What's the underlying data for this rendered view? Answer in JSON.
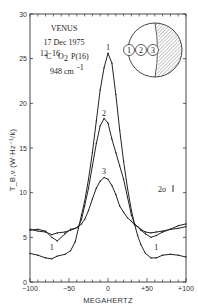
{
  "chart_data": {
    "type": "line",
    "title": "VENUS",
    "annotations": {
      "target": "VENUS",
      "date": "17 Dec 1975",
      "molecule_prefix1": "12",
      "molecule_c": "C",
      "molecule_prefix2": "16",
      "molecule_o": "O",
      "molecule_sub": "2",
      "line": "P(16)",
      "wavenumber": "948 cm",
      "wavenumber_exp": "-1",
      "error_bar": "2σ",
      "inset_labels": [
        "1",
        "2",
        "3"
      ]
    },
    "xlabel": "MEGAHERTZ",
    "ylabel": "T_B,ν (W·Hz⁻¹/k)",
    "xlim": [
      -100,
      100
    ],
    "ylim": [
      0,
      30
    ],
    "x_ticks": [
      "-100",
      "-50",
      "0",
      "+50",
      "+100"
    ],
    "y_ticks": [
      "0",
      "5",
      "10",
      "15",
      "20",
      "25",
      "30"
    ],
    "grid": false,
    "series": [
      {
        "name": "1",
        "x": [
          -100,
          -90,
          -80,
          -72,
          -65,
          -55,
          -48,
          -42,
          -38,
          -34,
          -30,
          -25,
          -20,
          -15,
          -10,
          -5,
          0,
          5,
          10,
          15,
          20,
          25,
          30,
          34,
          38,
          42,
          48,
          55,
          62,
          70,
          80,
          90,
          100
        ],
        "values": [
          3.2,
          3.0,
          2.7,
          2.6,
          2.9,
          3.1,
          3.5,
          4.5,
          6.0,
          7.5,
          9.0,
          11.5,
          14.5,
          18.0,
          21.5,
          24.0,
          25.6,
          24.5,
          21.0,
          17.0,
          13.5,
          10.5,
          8.0,
          6.5,
          5.2,
          4.2,
          3.2,
          2.7,
          2.7,
          3.0,
          3.1,
          3.0,
          2.8
        ]
      },
      {
        "name": "2",
        "x": [
          -100,
          -90,
          -80,
          -72,
          -65,
          -55,
          -48,
          -42,
          -38,
          -34,
          -30,
          -25,
          -20,
          -15,
          -10,
          -5,
          0,
          5,
          10,
          15,
          20,
          25,
          30,
          34,
          38,
          42,
          48,
          55,
          62,
          70,
          80,
          90,
          100
        ],
        "values": [
          5.9,
          5.7,
          5.6,
          5.3,
          5.5,
          5.6,
          5.8,
          6.0,
          6.2,
          7.0,
          8.5,
          10.5,
          13.0,
          15.5,
          17.5,
          18.3,
          17.8,
          16.0,
          14.5,
          13.0,
          11.5,
          9.5,
          7.5,
          6.5,
          6.2,
          5.9,
          5.6,
          5.5,
          5.6,
          5.7,
          5.9,
          6.0,
          6.2
        ]
      },
      {
        "name": "3",
        "x": [
          -100,
          -90,
          -80,
          -72,
          -65,
          -55,
          -48,
          -42,
          -38,
          -34,
          -30,
          -25,
          -20,
          -15,
          -10,
          -5,
          0,
          5,
          10,
          15,
          20,
          25,
          30,
          34,
          38,
          42,
          48,
          55,
          62,
          70,
          80,
          90,
          100
        ],
        "values": [
          5.8,
          5.9,
          5.7,
          5.0,
          4.6,
          5.4,
          5.9,
          6.0,
          6.2,
          6.5,
          7.0,
          8.0,
          9.3,
          10.5,
          11.3,
          11.7,
          11.5,
          10.8,
          9.8,
          8.5,
          7.8,
          7.2,
          6.8,
          6.4,
          6.2,
          5.8,
          5.4,
          5.0,
          5.2,
          5.6,
          5.9,
          6.3,
          6.5
        ]
      }
    ]
  }
}
